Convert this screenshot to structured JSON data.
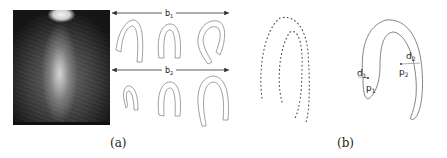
{
  "figure": {
    "panel_a": {
      "caption": "(a)",
      "image_description": "echocardiography ultrasound frame",
      "mode_labels": {
        "b1": "b",
        "b1_sub": "1",
        "b2": "b",
        "b2_sub": "2"
      },
      "rows": [
        {
          "label": "b1",
          "shape_count": 3
        },
        {
          "label": "b2",
          "shape_count": 3
        }
      ]
    },
    "panel_b": {
      "caption": "(b)",
      "left_shape": "dotted landmark contour",
      "right_shape": "continuous contour",
      "annotations": {
        "d1": "d",
        "d1_sub": "1",
        "p1": "p",
        "p1_sub": "1",
        "d2": "d",
        "d2_sub": "2",
        "p2": "p",
        "p2_sub": "2"
      }
    }
  }
}
